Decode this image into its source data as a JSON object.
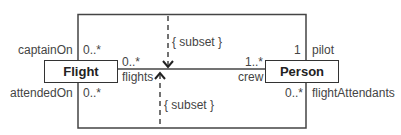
{
  "diagram": {
    "type": "UML class diagram",
    "classes": [
      {
        "id": "flight",
        "name": "Flight"
      },
      {
        "id": "person",
        "name": "Person"
      }
    ],
    "associations": [
      {
        "name": "captain",
        "left_role": "captainOn",
        "left_mult": "0..*",
        "right_role": "pilot",
        "right_mult": "1"
      },
      {
        "name": "crew",
        "left_role": "flights",
        "left_mult": "0..*",
        "right_role": "crew",
        "right_mult": "1..*"
      },
      {
        "name": "attendants",
        "left_role": "attendedOn",
        "left_mult": "0..*",
        "right_role": "flightAttendants",
        "right_mult": "0..*"
      }
    ],
    "constraints": [
      {
        "label": "{ subset }",
        "direction": "down"
      },
      {
        "label": "{ subset }",
        "direction": "up"
      }
    ]
  }
}
